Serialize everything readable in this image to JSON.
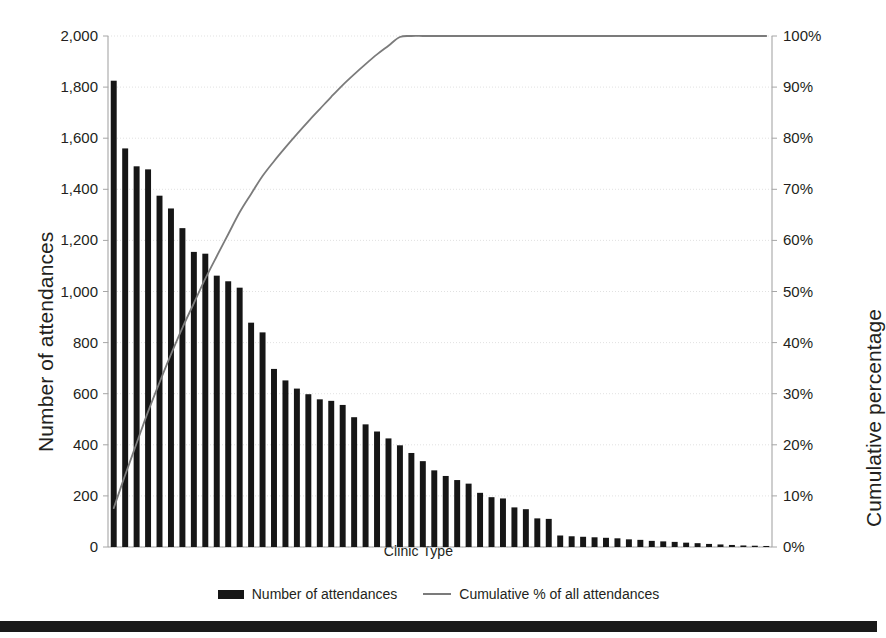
{
  "chart_data": {
    "type": "bar",
    "title": "",
    "subtitle": "",
    "xlabel": "Clinic Type",
    "ylabel": "Number of attendances",
    "y2label": "Cumulative percentage",
    "grid": true,
    "legend_position": "bottom",
    "ylim": [
      0,
      2000
    ],
    "y2lim": [
      0,
      100
    ],
    "y_ticks": [
      "0",
      "200",
      "400",
      "600",
      "800",
      "1,000",
      "1,200",
      "1,400",
      "1,600",
      "1,800",
      "2,000"
    ],
    "y_tick_values": [
      0,
      200,
      400,
      600,
      800,
      1000,
      1200,
      1400,
      1600,
      1800,
      2000
    ],
    "y2_ticks": [
      "0%",
      "10%",
      "20%",
      "30%",
      "40%",
      "50%",
      "60%",
      "70%",
      "80%",
      "90%",
      "100%"
    ],
    "y2_tick_values": [
      0,
      10,
      20,
      30,
      40,
      50,
      60,
      70,
      80,
      90,
      100
    ],
    "x_tick_labels": [],
    "categories": [
      "C1",
      "C2",
      "C3",
      "C4",
      "C5",
      "C6",
      "C7",
      "C8",
      "C9",
      "C10",
      "C11",
      "C12",
      "C13",
      "C14",
      "C15",
      "C16",
      "C17",
      "C18",
      "C19",
      "C20",
      "C21",
      "C22",
      "C23",
      "C24",
      "C25",
      "C26",
      "C27",
      "C28",
      "C29",
      "C30",
      "C31",
      "C32",
      "C33",
      "C34",
      "C35",
      "C36",
      "C37",
      "C38",
      "C39",
      "C40",
      "C41",
      "C42",
      "C43",
      "C44",
      "C45",
      "C46",
      "C47",
      "C48",
      "C49",
      "C50",
      "C51",
      "C52",
      "C53",
      "C54",
      "C55",
      "C56",
      "C57",
      "C58"
    ],
    "series": [
      {
        "name": "Number of attendances",
        "type": "bar",
        "axis": "left",
        "color": "#161616",
        "values": [
          1825,
          1560,
          1490,
          1478,
          1375,
          1325,
          1248,
          1155,
          1148,
          1062,
          1040,
          1015,
          878,
          840,
          697,
          652,
          620,
          598,
          578,
          572,
          556,
          508,
          480,
          452,
          425,
          398,
          368,
          336,
          300,
          278,
          262,
          248,
          212,
          195,
          190,
          155,
          148,
          112,
          110,
          45,
          42,
          40,
          38,
          36,
          34,
          30,
          28,
          24,
          22,
          20,
          17,
          15,
          12,
          10,
          8,
          6,
          5,
          4
        ]
      },
      {
        "name": "Cumulative % of all attendances",
        "type": "line",
        "axis": "right",
        "color": "#7b7b7b",
        "values": [
          7.6,
          14.1,
          20.3,
          26.5,
          32.2,
          37.7,
          42.9,
          47.7,
          52.5,
          56.9,
          61.2,
          65.5,
          69.1,
          72.6,
          75.5,
          78.2,
          80.8,
          83.3,
          85.7,
          88.1,
          90.4,
          92.5,
          94.5,
          96.4,
          98.1,
          99.8,
          101.3,
          102.7,
          103.9,
          105.1,
          106.2,
          107.2,
          108.1,
          108.9,
          109.7,
          110.3,
          110.9,
          111.4,
          111.8,
          112.0,
          112.2,
          112.4,
          112.5,
          112.7,
          112.8,
          112.9,
          113.0,
          113.1,
          113.2,
          113.3,
          113.3,
          113.4,
          113.4,
          113.5,
          113.5,
          113.5,
          113.6,
          113.6
        ],
        "cumulative_percent": [
          7.6,
          14.1,
          20.3,
          26.5,
          32.2,
          37.7,
          42.9,
          47.7,
          52.5,
          56.9,
          61.2,
          65.5,
          69.1,
          72.6,
          75.5,
          78.2,
          80.8,
          83.3,
          85.7,
          88.1,
          90.4,
          92.5,
          94.5,
          96.4,
          98.1,
          99.8,
          100.0,
          100.0,
          100.0,
          100.0,
          100.0,
          100.0,
          100.0,
          100.0,
          100.0,
          100.0,
          100.0,
          100.0,
          100.0,
          100.0,
          100.0,
          100.0,
          100.0,
          100.0,
          100.0,
          100.0,
          100.0,
          100.0,
          100.0,
          100.0,
          100.0,
          100.0,
          100.0,
          100.0,
          100.0,
          100.0,
          100.0,
          100.0
        ]
      }
    ],
    "legend": [
      {
        "label": "Number of attendances",
        "marker": "bar-swatch",
        "color": "#161616"
      },
      {
        "label": "Cumulative % of all attendances",
        "marker": "line-swatch",
        "color": "#7b7b7b"
      }
    ],
    "annotations": []
  },
  "figure": {
    "background_color": "#ffffff",
    "bar_color": "#161616",
    "line_color": "#7b7b7b",
    "grid_color": "#d9d9d9",
    "axis_color": "#a6a6a6",
    "text_color": "#231f20",
    "bottom_rule_color": "#1a1a1a"
  }
}
